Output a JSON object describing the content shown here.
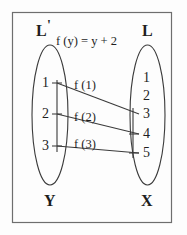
{
  "figure": {
    "formula": "f (y) = y + 2",
    "domain_set": {
      "top_label": "L",
      "top_label_prime": "'",
      "bottom_label": "Y",
      "elements": [
        "1",
        "2",
        "3"
      ]
    },
    "codomain_set": {
      "top_label": "L",
      "bottom_label": "X",
      "elements": [
        "1",
        "2",
        "3",
        "4",
        "5"
      ]
    },
    "mappings": [
      {
        "label": "f (1)",
        "from": "1",
        "to": "3"
      },
      {
        "label": "f (2)",
        "from": "2",
        "to": "4"
      },
      {
        "label": "f (3)",
        "from": "3",
        "to": "5"
      }
    ],
    "colors": {
      "ink": "#1e1e1e",
      "stroke": "#3a3a3a",
      "frame": "#6e6e6e",
      "background": "#fdfdfd"
    }
  }
}
